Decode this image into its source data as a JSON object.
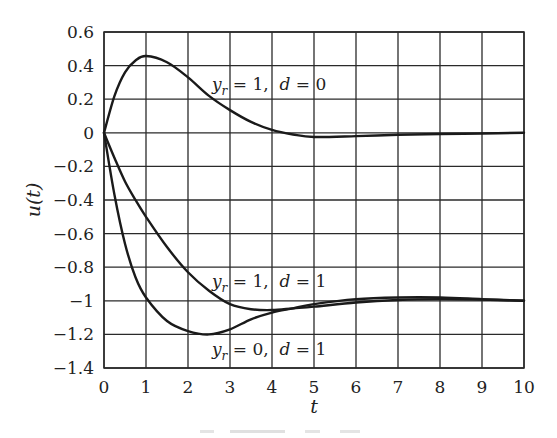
{
  "chart_data": {
    "type": "line",
    "title": "",
    "xlabel": "t",
    "ylabel": "u(t)",
    "xlim": [
      0,
      10
    ],
    "ylim": [
      -1.4,
      0.6
    ],
    "grid": true,
    "legend": "none (inline curve labels)",
    "x_ticks": [
      "0",
      "1",
      "2",
      "3",
      "4",
      "5",
      "6",
      "7",
      "8",
      "9",
      "10"
    ],
    "y_ticks": [
      "0.6",
      "0.4",
      "0.2",
      "0",
      "−0.2",
      "−0.4",
      "−0.6",
      "−0.8",
      "−1",
      "−1.2",
      "−1.4"
    ],
    "x": [
      0,
      0.25,
      0.5,
      0.75,
      1,
      1.5,
      2,
      2.5,
      3,
      3.5,
      4,
      4.5,
      5,
      6,
      7,
      8,
      9,
      10
    ],
    "series": [
      {
        "name": "y_r = 1, d = 0",
        "values": [
          0,
          0.22,
          0.36,
          0.43,
          0.457,
          0.42,
          0.33,
          0.22,
          0.135,
          0.065,
          0.017,
          -0.01,
          -0.025,
          -0.02,
          -0.012,
          -0.007,
          -0.004,
          0
        ]
      },
      {
        "name": "y_r = 1, d = 1",
        "values": [
          0,
          -0.15,
          -0.29,
          -0.4,
          -0.5,
          -0.68,
          -0.83,
          -0.94,
          -1.02,
          -1.05,
          -1.055,
          -1.045,
          -1.035,
          -1.01,
          -0.995,
          -0.99,
          -0.993,
          -1.0
        ]
      },
      {
        "name": "y_r = 0, d = 1",
        "values": [
          0,
          -0.37,
          -0.66,
          -0.86,
          -0.98,
          -1.12,
          -1.18,
          -1.2,
          -1.17,
          -1.11,
          -1.07,
          -1.045,
          -1.02,
          -0.99,
          -0.98,
          -0.98,
          -0.99,
          -1.0
        ]
      }
    ],
    "annotations": [
      {
        "text": "y_r = 1,  d = 0",
        "x": 2.6,
        "y": 0.22
      },
      {
        "text": "y_r = 1,  d = 1",
        "x": 2.6,
        "y": -0.9
      },
      {
        "text": "y_r = 0,  d = 1",
        "x": 2.6,
        "y": -1.3
      }
    ]
  },
  "labels": {
    "x_axis": "t",
    "y_axis": "u(t)",
    "curve1": {
      "y": "y",
      "sub": "r",
      "mid": " = 1,  ",
      "d": "d",
      "end": " = 0"
    },
    "curve2": {
      "y": "y",
      "sub": "r",
      "mid": " = 1,  ",
      "d": "d",
      "end": " = 1"
    },
    "curve3": {
      "y": "y",
      "sub": "r",
      "mid": " = 0,  ",
      "d": "d",
      "end": " = 1"
    }
  }
}
